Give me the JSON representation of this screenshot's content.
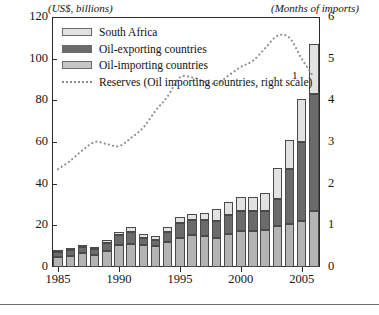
{
  "chart_data": {
    "type": "bar",
    "title": "",
    "subtitle": "",
    "left_axis_caption": "(US$, billions)",
    "right_axis_caption": "(Months of imports)",
    "xlabel": "",
    "ylabel": "US$, billions",
    "y2label": "Months of imports",
    "ylim": [
      0,
      120
    ],
    "y2lim": [
      0,
      6
    ],
    "xlim": [
      1985,
      2006
    ],
    "grid": false,
    "legend_position": "top-left",
    "footnote_marker": "1",
    "yticks": [
      0,
      20,
      40,
      60,
      80,
      100,
      120
    ],
    "y2ticks": [
      0,
      1,
      2,
      3,
      4,
      5,
      6
    ],
    "xticks": [
      1985,
      1990,
      1995,
      2000,
      2005
    ],
    "categories": [
      1985,
      1986,
      1987,
      1988,
      1989,
      1990,
      1991,
      1992,
      1993,
      1994,
      1995,
      1996,
      1997,
      1998,
      1999,
      2000,
      2001,
      2002,
      2003,
      2004,
      2005,
      2006
    ],
    "stacked": true,
    "series": [
      {
        "name": "Oil-importing countries",
        "color": "#b4b4b4",
        "values": [
          5.0,
          5.5,
          6.5,
          6.0,
          7.5,
          10.5,
          11.0,
          10.5,
          10.0,
          12.0,
          14.0,
          15.5,
          15.0,
          14.0,
          16.0,
          17.5,
          17.5,
          18.0,
          19.5,
          20.5,
          22.0,
          27.0
        ]
      },
      {
        "name": "Oil-exporting countries",
        "color": "#6b6b6b",
        "values": [
          2.0,
          2.5,
          3.0,
          2.5,
          4.0,
          5.0,
          6.0,
          3.5,
          3.0,
          5.0,
          7.0,
          7.0,
          7.5,
          8.0,
          9.0,
          9.5,
          9.5,
          9.0,
          13.0,
          26.5,
          38.0,
          56.0
        ]
      },
      {
        "name": "South Africa",
        "color": "#e2e2e2",
        "values": [
          0.8,
          0.8,
          1.0,
          1.0,
          1.5,
          1.5,
          2.0,
          2.0,
          2.0,
          2.0,
          3.0,
          3.0,
          3.5,
          6.0,
          6.0,
          6.5,
          6.5,
          8.5,
          15.0,
          14.0,
          20.5,
          24.0
        ]
      }
    ],
    "line_series": {
      "name": "Reserves (Oil importing countries, right scale)",
      "color": "#8c8c8c",
      "style": "dotted",
      "axis": "right",
      "x": [
        1985,
        1986,
        1987,
        1988,
        1989,
        1990,
        1991,
        1992,
        1993,
        1994,
        1995,
        1996,
        1997,
        1998,
        1999,
        2000,
        2001,
        2002,
        2003,
        2004,
        2005,
        2006
      ],
      "values": [
        2.35,
        2.55,
        2.8,
        3.0,
        2.95,
        2.9,
        3.1,
        3.35,
        3.75,
        4.1,
        4.55,
        4.55,
        4.45,
        4.4,
        4.6,
        4.8,
        4.95,
        5.25,
        5.55,
        5.5,
        5.0,
        4.55
      ]
    }
  },
  "legend": {
    "items": [
      {
        "label": "South Africa",
        "swatch": "sa"
      },
      {
        "label": "Oil-exporting countries",
        "swatch": "exp"
      },
      {
        "label": "Oil-importing countries",
        "swatch": "imp"
      },
      {
        "label": "Reserves (Oil importing countries, right scale)",
        "swatch": "line"
      }
    ]
  },
  "axis_labels": {
    "y_left": [
      "120",
      "100",
      "80",
      "60",
      "40",
      "20",
      "0"
    ],
    "y_right": [
      "6",
      "5",
      "4",
      "3",
      "2",
      "1",
      "0"
    ],
    "x": [
      "1985",
      "1990",
      "1995",
      "2000",
      "2005"
    ]
  }
}
